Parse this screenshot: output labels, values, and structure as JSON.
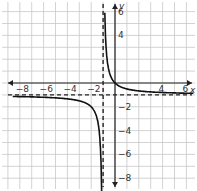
{
  "chart_data": {
    "type": "line",
    "title": "",
    "xlabel": "x",
    "ylabel": "y",
    "xlim": [
      -8.5,
      6.8
    ],
    "ylim": [
      -8.5,
      6.8
    ],
    "grid": true,
    "x_ticks": [
      -8,
      -6,
      -4,
      -2,
      4,
      6
    ],
    "x_tick_labels": [
      "−8",
      "−6",
      "−4",
      "−2",
      "4",
      "6"
    ],
    "y_ticks": [
      6,
      4,
      -2,
      -4,
      -6,
      -8
    ],
    "y_tick_labels": [
      "6",
      "4",
      "−2",
      "−4",
      "−6",
      "−8"
    ],
    "asymptotes": {
      "vertical": -1,
      "horizontal": -1
    },
    "function": "y = 1/(x+1) - 1",
    "series": [
      {
        "name": "right-branch",
        "x": [
          -0.85,
          -0.7,
          -0.5,
          0,
          1,
          2,
          4,
          6.5
        ],
        "values": [
          5.67,
          2.33,
          1,
          0,
          -0.5,
          -0.67,
          -0.8,
          -0.87
        ]
      },
      {
        "name": "left-branch",
        "x": [
          -8.5,
          -6,
          -4,
          -2,
          -1.5,
          -1.2,
          -1.13
        ],
        "values": [
          -1.13,
          -1.2,
          -1.33,
          -2,
          -3,
          -6,
          -8.5
        ]
      }
    ]
  },
  "labels": {
    "x_axis": "x",
    "y_axis": "y"
  },
  "colors": {
    "curve": "#111111",
    "grid": "#c8c8c8",
    "axis": "#222222"
  }
}
